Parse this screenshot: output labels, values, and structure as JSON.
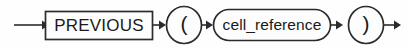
{
  "diagram": {
    "type": "railroad-syntax-diagram",
    "title": "PREVIOUS",
    "background_color": "#fefefe",
    "stroke_color": "#2b2b2b",
    "text_color": "#1a1a1a",
    "nodes": [
      {
        "id": "entry-arrow",
        "kind": "arrow",
        "label": ""
      },
      {
        "id": "keyword-previous",
        "kind": "terminal-box",
        "label": "PREVIOUS"
      },
      {
        "id": "open-paren",
        "kind": "terminal-circle",
        "label": "("
      },
      {
        "id": "cell-reference",
        "kind": "nonterminal-stadium",
        "label": "cell_reference"
      },
      {
        "id": "close-paren",
        "kind": "terminal-circle",
        "label": ")"
      },
      {
        "id": "exit-arrow",
        "kind": "arrow",
        "label": ""
      }
    ]
  }
}
